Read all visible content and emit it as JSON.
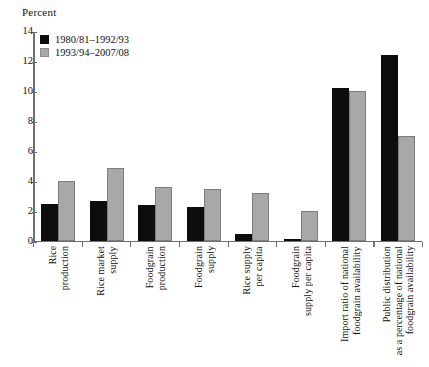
{
  "chart_data": {
    "type": "bar",
    "title": "",
    "ylabel": "Percent",
    "xlabel": "",
    "ylim": [
      0,
      14
    ],
    "yticks": [
      0,
      2,
      4,
      6,
      8,
      10,
      12,
      14
    ],
    "grid": false,
    "legend_position": "top-left",
    "categories": [
      "Rice\nproduction",
      "Rice market\nsupply",
      "Foodgrain\nproduction",
      "Foodgrain\nsupply",
      "Rice supply\nper capita",
      "Foodgrain\nsupply per capita",
      "Import ratio of national\nfoodgrain availability",
      "Public distribution\nas a percentage of national\nfoodgrain availability"
    ],
    "series": [
      {
        "name": "1980/81–1992/93",
        "color": "#0d0d0d",
        "values": [
          2.5,
          2.7,
          2.4,
          2.3,
          0.5,
          0.1,
          10.2,
          12.4
        ]
      },
      {
        "name": "1993/94–2007/08",
        "color": "#a8a8a8",
        "values": [
          4.0,
          4.9,
          3.6,
          3.5,
          3.2,
          2.0,
          10.0,
          7.0
        ]
      }
    ]
  }
}
